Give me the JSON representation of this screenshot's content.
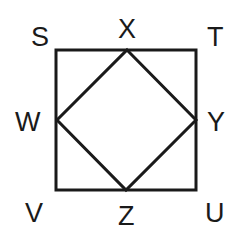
{
  "diagram": {
    "type": "geometry",
    "outer_square": {
      "vertices": [
        "S",
        "T",
        "U",
        "V"
      ],
      "coords": {
        "S": [
          56,
          50
        ],
        "T": [
          196,
          50
        ],
        "U": [
          196,
          190
        ],
        "V": [
          56,
          190
        ]
      }
    },
    "inner_square": {
      "vertices": [
        "X",
        "Y",
        "Z",
        "W"
      ],
      "coords": {
        "X": [
          127,
          50
        ],
        "Y": [
          196,
          120
        ],
        "Z": [
          126,
          190
        ],
        "W": [
          57,
          120
        ]
      }
    },
    "labels": {
      "S": "S",
      "X": "X",
      "T": "T",
      "W": "W",
      "Y": "Y",
      "V": "V",
      "Z": "Z",
      "U": "U"
    },
    "stroke_color": "#1a1a1a"
  }
}
